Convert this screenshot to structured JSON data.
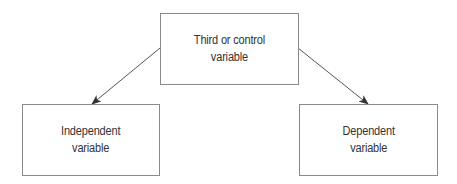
{
  "diagram": {
    "type": "causal-diagram",
    "colors": {
      "border": "#8a8a8a",
      "text": "#333333",
      "arrow": "#555555",
      "background": "#ffffff"
    },
    "nodes": [
      {
        "id": "third",
        "lines": [
          "Third or control",
          "variable"
        ],
        "box": {
          "x": 160,
          "y": 13,
          "w": 139,
          "h": 72
        }
      },
      {
        "id": "independent",
        "lines": [
          "Independent",
          "variable"
        ],
        "box": {
          "x": 22,
          "y": 104,
          "w": 138,
          "h": 72
        }
      },
      {
        "id": "dependent",
        "lines": [
          "Dependent",
          "variable"
        ],
        "box": {
          "x": 299,
          "y": 104,
          "w": 139,
          "h": 72
        }
      }
    ],
    "edges": [
      {
        "from": "third",
        "to": "independent",
        "x1": 160,
        "y1": 48,
        "x2": 92,
        "y2": 104
      },
      {
        "from": "third",
        "to": "dependent",
        "x1": 298,
        "y1": 48,
        "x2": 368,
        "y2": 104
      }
    ]
  }
}
